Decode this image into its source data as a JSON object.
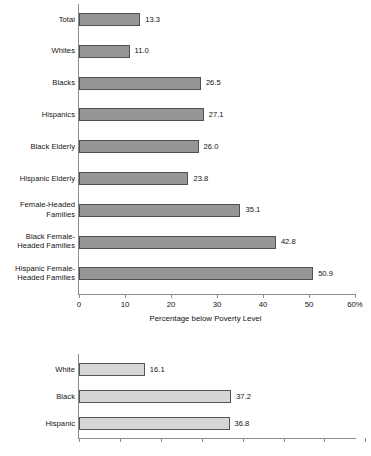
{
  "chart_data": [
    {
      "id": "poverty-by-group",
      "type": "bar",
      "orientation": "horizontal",
      "title": "",
      "xlabel": "Percentage below Poverty Level",
      "ylabel": "",
      "xlim": [
        0,
        60
      ],
      "xticks": [
        0,
        10,
        20,
        30,
        40,
        50,
        60
      ],
      "xtick_labels": [
        "0",
        "10",
        "20",
        "30",
        "40",
        "50",
        "60%"
      ],
      "grid": false,
      "legend": "none",
      "bar_color": "#969696",
      "bar_edge_color": "#4f4f4f",
      "categories": [
        "Total",
        "Whites",
        "Blacks",
        "Hispanics",
        "Black Elderly",
        "Hispanic Elderly",
        "Female-Headed\nFamilies",
        "Black Female-\nHeaded Families",
        "Hispanic Female-\nHeaded Families"
      ],
      "values": [
        13.3,
        11.0,
        26.5,
        27.1,
        26.0,
        23.8,
        35.1,
        42.8,
        50.9
      ],
      "value_labels": [
        "13.3",
        "11.0",
        "26.5",
        "27.1",
        "26.0",
        "23.8",
        "35.1",
        "42.8",
        "50.9"
      ]
    },
    {
      "id": "poverty-by-race",
      "type": "bar",
      "orientation": "horizontal",
      "title": "",
      "xlabel": "",
      "ylabel": "",
      "xlim": [
        0,
        70
      ],
      "xticks": [
        0,
        10,
        20,
        30,
        40,
        50,
        60,
        70
      ],
      "xtick_labels": [
        "",
        "",
        "",
        "",
        "",
        "",
        "",
        ""
      ],
      "grid": false,
      "legend": "none",
      "bar_color": "#d6d6d6",
      "bar_edge_color": "#555555",
      "categories": [
        "White",
        "Black",
        "Hispanic"
      ],
      "values": [
        16.1,
        37.2,
        36.8
      ],
      "value_labels": [
        "16.1",
        "37.2",
        "36.8"
      ]
    }
  ]
}
